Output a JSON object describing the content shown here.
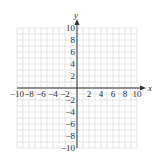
{
  "chart_data": {
    "type": "scatter",
    "title": "",
    "xlabel": "x",
    "ylabel": "y",
    "xlim": [
      -10,
      10
    ],
    "ylim": [
      -10,
      10
    ],
    "grid": true,
    "grid_step": 1,
    "x_ticks": [
      -10,
      -8,
      -6,
      -4,
      -2,
      2,
      4,
      6,
      8,
      10
    ],
    "y_ticks": [
      10,
      8,
      6,
      4,
      2,
      -2,
      -4,
      -6,
      -8,
      -10
    ],
    "x_tick_labels": [
      "−10",
      "−8",
      "−6",
      "−4",
      "−2",
      "2",
      "4",
      "6",
      "8",
      "10"
    ],
    "y_tick_labels": [
      "10",
      "8",
      "6",
      "4",
      "2",
      "−2",
      "−4",
      "−6",
      "−8",
      "−10"
    ],
    "series": [],
    "legend": null
  },
  "colors": {
    "grid": "#d4d4d4",
    "axis": "#333333",
    "text": "#333333"
  }
}
